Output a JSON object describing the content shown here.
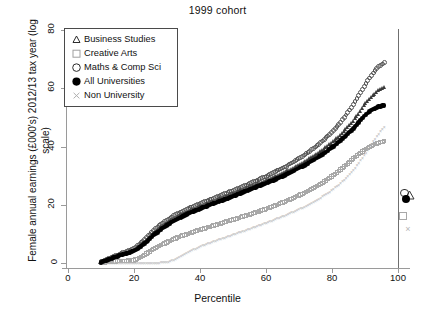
{
  "chart_data": {
    "type": "scatter",
    "title": "1999 cohort",
    "xlabel": "Percentile",
    "ylabel": "Female annual earnings (£000's) 2012/13 tax year (log scale)",
    "xlim": [
      0,
      107
    ],
    "ylim": [
      0,
      84
    ],
    "xticks": [
      0,
      20,
      40,
      60,
      80,
      100
    ],
    "yticks": [
      0,
      20,
      40,
      60,
      80
    ],
    "grid": false,
    "legend_position": "top-left",
    "x": [
      10,
      12,
      14,
      16,
      18,
      20,
      22,
      24,
      26,
      28,
      30,
      32,
      34,
      36,
      38,
      40,
      42,
      44,
      46,
      48,
      50,
      52,
      54,
      56,
      58,
      60,
      62,
      64,
      66,
      68,
      70,
      72,
      74,
      76,
      78,
      80,
      82,
      84,
      86,
      88,
      90,
      92,
      94,
      96
    ],
    "series": [
      {
        "name": "Business Studies",
        "marker": "triangle",
        "color": "#3a3a3a",
        "values": [
          0.3,
          1.2,
          2.0,
          2.8,
          3.6,
          4.4,
          6.0,
          8.0,
          10.2,
          12.0,
          13.6,
          15.0,
          16.2,
          17.3,
          18.3,
          19.2,
          20.1,
          21.0,
          21.9,
          22.8,
          23.7,
          24.6,
          25.5,
          26.4,
          27.3,
          28.2,
          29.2,
          30.2,
          31.3,
          32.4,
          33.6,
          34.9,
          36.3,
          37.8,
          39.4,
          41.2,
          43.2,
          45.5,
          48.0,
          51.0,
          54.5,
          57.0,
          59.0,
          60.5
        ],
        "mean": 23.5
      },
      {
        "name": "Creative Arts",
        "marker": "square",
        "color": "#a8a8a8",
        "values": [
          0.1,
          0.3,
          0.5,
          0.7,
          0.8,
          0.9,
          2.0,
          3.4,
          4.8,
          6.0,
          7.2,
          8.2,
          9.1,
          9.9,
          10.7,
          11.4,
          12.1,
          12.8,
          13.5,
          14.2,
          14.9,
          15.6,
          16.3,
          17.0,
          17.8,
          18.6,
          19.4,
          20.3,
          21.2,
          22.2,
          23.2,
          24.3,
          25.5,
          26.8,
          28.2,
          29.8,
          31.5,
          33.4,
          35.4,
          37.3,
          39.0,
          40.3,
          41.2,
          41.9
        ],
        "mean": 16.0
      },
      {
        "name": "Maths & Comp Sci",
        "marker": "open-circle",
        "color": "#555555",
        "values": [
          0.4,
          1.4,
          2.3,
          3.2,
          4.1,
          5.0,
          6.8,
          9.0,
          11.3,
          13.2,
          14.8,
          16.2,
          17.4,
          18.5,
          19.5,
          20.4,
          21.3,
          22.2,
          23.1,
          24.0,
          24.9,
          25.8,
          26.8,
          27.8,
          28.8,
          29.8,
          30.9,
          32.0,
          33.2,
          34.5,
          35.9,
          37.4,
          39.0,
          40.8,
          42.8,
          45.0,
          47.5,
          50.4,
          53.6,
          57.2,
          61.0,
          64.6,
          67.2,
          69.0
        ],
        "mean": 24.0
      },
      {
        "name": "All Universities",
        "marker": "filled-circle",
        "color": "#000000",
        "values": [
          0.25,
          1.1,
          1.9,
          2.7,
          3.4,
          4.1,
          5.6,
          7.5,
          9.6,
          11.4,
          13.0,
          14.4,
          15.6,
          16.7,
          17.7,
          18.6,
          19.5,
          20.4,
          21.2,
          22.0,
          22.9,
          23.8,
          24.7,
          25.6,
          26.5,
          27.4,
          28.3,
          29.3,
          30.3,
          31.4,
          32.6,
          33.8,
          35.1,
          36.5,
          38.0,
          39.7,
          41.5,
          43.5,
          45.7,
          48.2,
          50.8,
          52.6,
          53.6,
          54.2
        ],
        "mean": 22.0
      },
      {
        "name": "Non University",
        "marker": "cross",
        "color": "#b5b5b5",
        "values": [
          0.0,
          0.0,
          0.0,
          0.0,
          0.0,
          0.0,
          0.0,
          0.0,
          0.0,
          0.0,
          0.1,
          1.0,
          2.2,
          3.4,
          4.5,
          5.5,
          6.4,
          7.2,
          8.0,
          8.8,
          9.6,
          10.4,
          11.2,
          12.0,
          12.8,
          13.6,
          14.5,
          15.4,
          16.3,
          17.3,
          18.3,
          19.4,
          20.6,
          21.9,
          23.3,
          24.9,
          26.7,
          28.8,
          31.2,
          34.0,
          37.2,
          40.8,
          44.0,
          46.8
        ],
        "mean": 11.5
      }
    ]
  },
  "legend": {
    "items": [
      {
        "label": "Business Studies",
        "marker": "triangle"
      },
      {
        "label": "Creative Arts",
        "marker": "square"
      },
      {
        "label": "Maths & Comp Sci",
        "marker": "open-circle"
      },
      {
        "label": "All Universities",
        "marker": "filled-circle"
      },
      {
        "label": "Non University",
        "marker": "cross"
      }
    ]
  }
}
